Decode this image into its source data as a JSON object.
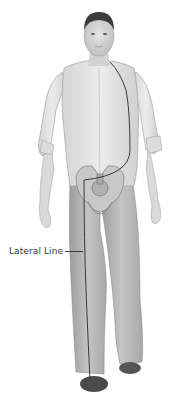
{
  "diagram": {
    "annotations": [
      {
        "label": "Lateral Line",
        "target": "lateral-line"
      }
    ],
    "colors": {
      "background": "#ffffff",
      "skin": "#d9d9d9",
      "shirt": "#e6e6e6",
      "pants": "#b5b5b5",
      "hair": "#3c3c3c",
      "shoes": "#4a4a4a",
      "line": "#3a3a3a"
    }
  }
}
